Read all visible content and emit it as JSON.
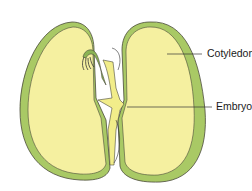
{
  "diagram": {
    "labels": [
      {
        "id": "cotyledon",
        "text": "Cotyledon",
        "x": 207,
        "y": 46
      },
      {
        "id": "embryo",
        "text": "Embryo",
        "x": 216,
        "y": 100
      }
    ],
    "colors": {
      "seed_coat": "#a9c965",
      "seed_coat_dark": "#8fb24d",
      "cotyledon_fill": "#f5f0a0",
      "embryo_green": "#8bb454",
      "outline": "#4a4a3a",
      "leader_line": "#333333"
    }
  }
}
